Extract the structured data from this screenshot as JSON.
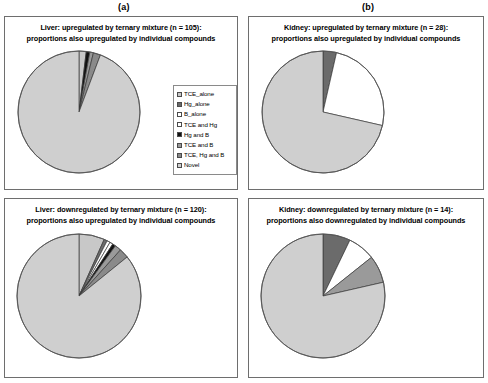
{
  "figure": {
    "panel_labels": [
      {
        "name": "panel-a",
        "text": "(a)"
      },
      {
        "name": "panel-b",
        "text": "(b)"
      }
    ]
  },
  "legend_entries": [
    {
      "label": "TCE_alone",
      "color": "#c8c8c8"
    },
    {
      "label": "Hg_alone",
      "color": "#6b6b6b"
    },
    {
      "label": "B_alone",
      "color": "#ffffff"
    },
    {
      "label": "TCE and Hg",
      "color": "#ffffff"
    },
    {
      "label": "Hg and B",
      "color": "#111111"
    },
    {
      "label": "TCE and B",
      "color": "#9a9a9a"
    },
    {
      "label": "TCE, Hg and B",
      "color": "#8a8a8a"
    },
    {
      "label": "Novel",
      "color": "#cfcfcf"
    }
  ],
  "charts": {
    "top_left": {
      "title_line1": "Liver: upregulated by ternary mixture (n = 105):",
      "title_line2": "proportions also upregulated by individual compounds"
    },
    "top_right": {
      "title_line1": "Kidney: upregulated by ternary mixture (n = 28):",
      "title_line2": "proportions also upregulated by individual compounds"
    },
    "bottom_left": {
      "title_line1": "Liver: downregulated by ternary mixture (n = 120):",
      "title_line2": "proportions also upregulated by individual compounds"
    },
    "bottom_right": {
      "title_line1": "Kidney: downregulated by ternary mixture (n = 14):",
      "title_line2": "proportions also downregulated by individual compounds"
    }
  },
  "chart_data": [
    {
      "type": "pie",
      "id": "liver-upregulated",
      "panel": "a",
      "position": "top-left",
      "title": "Liver: upregulated by ternary mixture (n = 105): proportions also upregulated by individual compounds",
      "total_n": 105,
      "categories": [
        "TCE_alone",
        "Hg_alone",
        "B_alone",
        "TCE and Hg",
        "Hg and B",
        "TCE and B",
        "TCE, Hg and B",
        "Novel"
      ],
      "values": [
        2,
        0,
        0,
        0,
        1,
        1,
        2,
        99
      ],
      "percentages": [
        1.9,
        0.0,
        0.0,
        0.0,
        1.0,
        1.0,
        1.9,
        94.3
      ],
      "colors": [
        "#c8c8c8",
        "#6b6b6b",
        "#ffffff",
        "#ffffff",
        "#111111",
        "#9a9a9a",
        "#8a8a8a",
        "#cfcfcf"
      ],
      "start_angle_deg": 0,
      "direction": "clockwise",
      "legend_position": "right"
    },
    {
      "type": "pie",
      "id": "kidney-upregulated",
      "panel": "b",
      "position": "top-right",
      "title": "Kidney: upregulated by ternary mixture (n = 28): proportions also upregulated by individual compounds",
      "total_n": 28,
      "categories": [
        "TCE_alone",
        "Hg_alone",
        "B_alone",
        "TCE and Hg",
        "Hg and B",
        "TCE and B",
        "TCE, Hg and B",
        "Novel"
      ],
      "values": [
        0,
        1,
        0,
        0,
        0,
        0,
        7,
        20
      ],
      "percentages": [
        0.0,
        3.6,
        0.0,
        0.0,
        0.0,
        0.0,
        25.0,
        71.4
      ],
      "colors": [
        "#c8c8c8",
        "#6b6b6b",
        "#ffffff",
        "#ffffff",
        "#111111",
        "#9a9a9a",
        "#ffffff",
        "#cfcfcf"
      ],
      "start_angle_deg": 0,
      "direction": "clockwise",
      "legend_position": "right"
    },
    {
      "type": "pie",
      "id": "liver-downregulated",
      "panel": "a",
      "position": "bottom-left",
      "title": "Liver: downregulated by ternary mixture (n = 120): proportions also upregulated by individual compounds",
      "total_n": 120,
      "categories": [
        "TCE_alone",
        "Hg_alone",
        "B_alone",
        "TCE and Hg",
        "Hg and B",
        "TCE and B",
        "TCE, Hg and B",
        "Novel"
      ],
      "values": [
        8,
        1,
        1,
        1,
        1,
        2,
        3,
        103
      ],
      "percentages": [
        6.7,
        0.8,
        0.8,
        0.8,
        0.8,
        1.7,
        2.5,
        85.9
      ],
      "colors": [
        "#c8c8c8",
        "#6b6b6b",
        "#ffffff",
        "#ffffff",
        "#111111",
        "#9a9a9a",
        "#8a8a8a",
        "#cfcfcf"
      ],
      "start_angle_deg": 0,
      "direction": "clockwise",
      "legend_position": "right"
    },
    {
      "type": "pie",
      "id": "kidney-downregulated",
      "panel": "b",
      "position": "bottom-right",
      "title": "Kidney: downregulated by ternary mixture (n = 14): proportions also downregulated by individual compounds",
      "total_n": 14,
      "categories": [
        "TCE_alone",
        "Hg_alone",
        "B_alone",
        "TCE and Hg",
        "Hg and B",
        "TCE and B",
        "TCE, Hg and B",
        "Novel"
      ],
      "values": [
        0,
        1,
        1,
        0,
        0,
        1,
        0,
        11
      ],
      "percentages": [
        0.0,
        7.1,
        7.1,
        0.0,
        0.0,
        7.1,
        0.0,
        78.6
      ],
      "colors": [
        "#c8c8c8",
        "#6b6b6b",
        "#ffffff",
        "#ffffff",
        "#111111",
        "#9a9a9a",
        "#8a8a8a",
        "#cfcfcf"
      ],
      "start_angle_deg": 0,
      "direction": "clockwise",
      "legend_position": "right"
    }
  ]
}
